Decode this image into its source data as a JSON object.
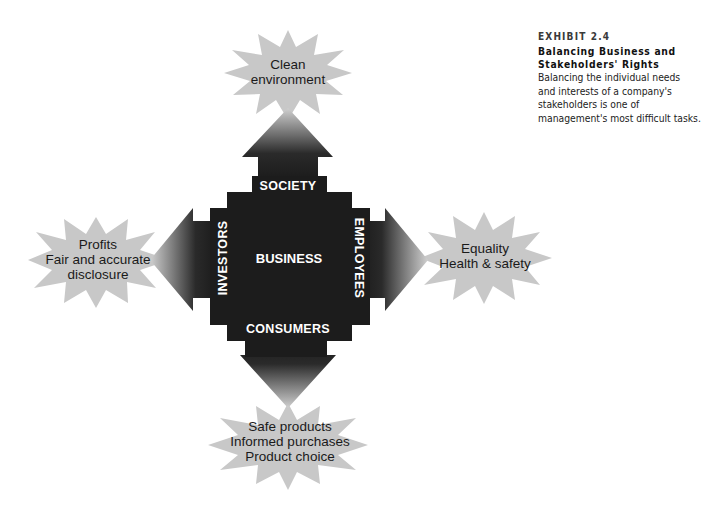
{
  "caption": {
    "exhibit_label": "EXHIBIT 2.4",
    "title_line1": "Balancing Business and",
    "title_line2": "Stakeholders' Rights",
    "body_lines": [
      "Balancing the individual needs",
      "and interests of a company's",
      "stakeholders is one of",
      "management's most difficult tasks."
    ]
  },
  "diagram": {
    "center_label": "BUSINESS",
    "stakeholders": {
      "top": "SOCIETY",
      "bottom": "CONSUMERS",
      "left": "INVESTORS",
      "right": "EMPLOYEES"
    },
    "rights": {
      "top": [
        "Clean",
        "environment"
      ],
      "left": [
        "Profits",
        "Fair and accurate",
        "disclosure"
      ],
      "right": [
        "Equality",
        "Health & safety"
      ],
      "bottom": [
        "Safe products",
        "Informed purchases",
        "Product choice"
      ]
    },
    "colors": {
      "core": "#1c1c1c",
      "burst": "#c8c8c8",
      "background": "#ffffff"
    }
  }
}
